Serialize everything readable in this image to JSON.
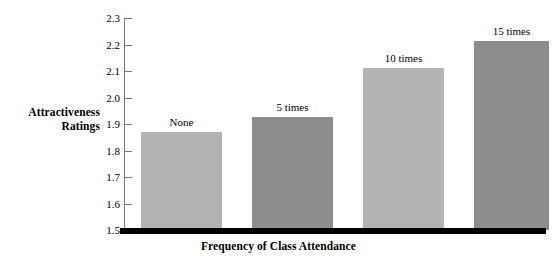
{
  "chart_data": {
    "type": "bar",
    "title": "",
    "xlabel": "Frequency of Class Attendance",
    "ylabel": "Attractiveness Ratings",
    "categories": [
      "None",
      "5 times",
      "10 times",
      "15 times"
    ],
    "values": [
      1.87,
      1.925,
      2.11,
      2.215
    ],
    "ylim": [
      1.5,
      2.3
    ],
    "ytick_step": 0.1,
    "yticks": [
      "2.3",
      "2.2",
      "2.1",
      "2.0",
      "1.9",
      "1.8",
      "1.7",
      "1.6",
      "1.5"
    ],
    "grid": false,
    "legend": null,
    "bar_colors": [
      "#b3b3b3",
      "#8c8c8c",
      "#b3b3b3",
      "#8c8c8c"
    ],
    "axis_color": "#7a7a7a",
    "baseline_color": "#000000",
    "background": "#ffffff"
  },
  "labels": {
    "y_axis_title_line1": "Attractiveness",
    "y_axis_title_line2": "Ratings",
    "x_axis_title": "Frequency of Class Attendance"
  },
  "bars": [
    {
      "category": "None",
      "value": 1.87,
      "value_label": "None",
      "color": "#b3b3b3"
    },
    {
      "category": "5 times",
      "value": 1.925,
      "value_label": "5 times",
      "color": "#8c8c8c"
    },
    {
      "category": "10 times",
      "value": 2.11,
      "value_label": "10 times",
      "color": "#b3b3b3"
    },
    {
      "category": "15 times",
      "value": 2.215,
      "value_label": "15 times",
      "color": "#8c8c8c"
    }
  ],
  "yticks": [
    {
      "label": "2.3"
    },
    {
      "label": "2.2"
    },
    {
      "label": "2.1"
    },
    {
      "label": "2.0"
    },
    {
      "label": "1.9"
    },
    {
      "label": "1.8"
    },
    {
      "label": "1.7"
    },
    {
      "label": "1.6"
    },
    {
      "label": "1.5"
    }
  ]
}
